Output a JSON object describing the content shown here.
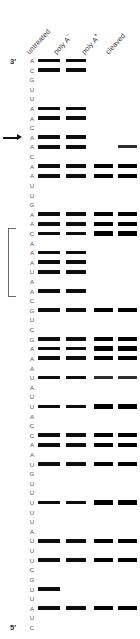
{
  "figure": {
    "type": "rna-sequencing-gel-autoradiogram",
    "width": 140,
    "height": 639
  },
  "headers": {
    "columns": [
      {
        "label": "untreated",
        "sup": "",
        "lane": "1"
      },
      {
        "label": "poly A",
        "sup": "−",
        "lane": "2"
      },
      {
        "label": "poly A",
        "sup": "+",
        "lane": "3"
      },
      {
        "label": "cleaved",
        "sup": "",
        "lane": "4"
      }
    ]
  },
  "termini": {
    "top": "3′",
    "bottom": "5′"
  },
  "lane_numbers": [
    "1",
    "2",
    "3",
    "4"
  ],
  "annotations": {
    "arrow": {
      "name": "cleavage-site-arrow",
      "base_index": 8
    },
    "bracket": {
      "name": "protected-region-bracket",
      "start_index": 18,
      "end_index": 24
    }
  },
  "colors": {
    "band": "#0d0d0d",
    "band_faint": "#2e2e2e",
    "sequence_text": "#555555",
    "header_text": "#3a3a3a",
    "bracket": "#6a6a6a",
    "background": "#ffffff"
  },
  "sequence": [
    "A",
    "C",
    "G",
    "U",
    "U",
    "A",
    "A",
    "C",
    "A",
    "A",
    "C",
    "A",
    "A",
    "U",
    "U",
    "G",
    "A",
    "A",
    "C",
    "A",
    "A",
    "A",
    "U",
    "A",
    "A",
    "C",
    "G",
    "U",
    "C",
    "G",
    "A",
    "A",
    "A",
    "U",
    "A",
    "U",
    "U",
    "A",
    "C",
    "C",
    "A",
    "A",
    "U",
    "G",
    "U",
    "U",
    "U",
    "U",
    "U",
    "A",
    "U",
    "U",
    "U",
    "C",
    "G",
    "U",
    "U",
    "A",
    "U",
    "C"
  ],
  "lanes_bands": [
    [
      1,
      1,
      0,
      0
    ],
    [
      1,
      1,
      0,
      0
    ],
    [
      0,
      0,
      0,
      0
    ],
    [
      0,
      0,
      0,
      0
    ],
    [
      0,
      0,
      0,
      0
    ],
    [
      1,
      1,
      0,
      0
    ],
    [
      1,
      1,
      0,
      0
    ],
    [
      0,
      0,
      0,
      0
    ],
    [
      1,
      1,
      0,
      0
    ],
    [
      1,
      1,
      0,
      1
    ],
    [
      0,
      0,
      0,
      0
    ],
    [
      1,
      1,
      1,
      1
    ],
    [
      1,
      1,
      1,
      1
    ],
    [
      0,
      0,
      0,
      0
    ],
    [
      0,
      0,
      0,
      0
    ],
    [
      0,
      0,
      0,
      0
    ],
    [
      1,
      1,
      1,
      1
    ],
    [
      1,
      1,
      1,
      1
    ],
    [
      1,
      1,
      1,
      1
    ],
    [
      0,
      0,
      0,
      0
    ],
    [
      1,
      1,
      0,
      0
    ],
    [
      1,
      1,
      0,
      0
    ],
    [
      1,
      1,
      0,
      0
    ],
    [
      0,
      0,
      0,
      0
    ],
    [
      1,
      1,
      0,
      0
    ],
    [
      0,
      0,
      0,
      0
    ],
    [
      1,
      1,
      1,
      1
    ],
    [
      0,
      0,
      0,
      0
    ],
    [
      0,
      0,
      0,
      0
    ],
    [
      1,
      1,
      1,
      1
    ],
    [
      1,
      1,
      1,
      1
    ],
    [
      1,
      1,
      1,
      1
    ],
    [
      0,
      0,
      0,
      0
    ],
    [
      1,
      1,
      1,
      1
    ],
    [
      0,
      0,
      0,
      0
    ],
    [
      0,
      0,
      0,
      0
    ],
    [
      1,
      1,
      1,
      1
    ],
    [
      0,
      0,
      0,
      0
    ],
    [
      0,
      0,
      0,
      0
    ],
    [
      1,
      1,
      1,
      1
    ],
    [
      1,
      1,
      1,
      1
    ],
    [
      0,
      0,
      0,
      0
    ],
    [
      1,
      1,
      1,
      1
    ],
    [
      0,
      0,
      0,
      0
    ],
    [
      0,
      0,
      0,
      0
    ],
    [
      0,
      0,
      0,
      0
    ],
    [
      1,
      1,
      1,
      1
    ],
    [
      0,
      0,
      0,
      0
    ],
    [
      0,
      0,
      0,
      0
    ],
    [
      0,
      0,
      0,
      0
    ],
    [
      1,
      1,
      1,
      1
    ],
    [
      0,
      0,
      0,
      0
    ],
    [
      1,
      1,
      1,
      1
    ],
    [
      0,
      0,
      0,
      0
    ],
    [
      0,
      0,
      0,
      0
    ],
    [
      1,
      0,
      0,
      0
    ],
    [
      0,
      0,
      0,
      0
    ],
    [
      1,
      1,
      1,
      1
    ],
    [
      0,
      0,
      0,
      0
    ],
    [
      0,
      0,
      0,
      0
    ]
  ]
}
